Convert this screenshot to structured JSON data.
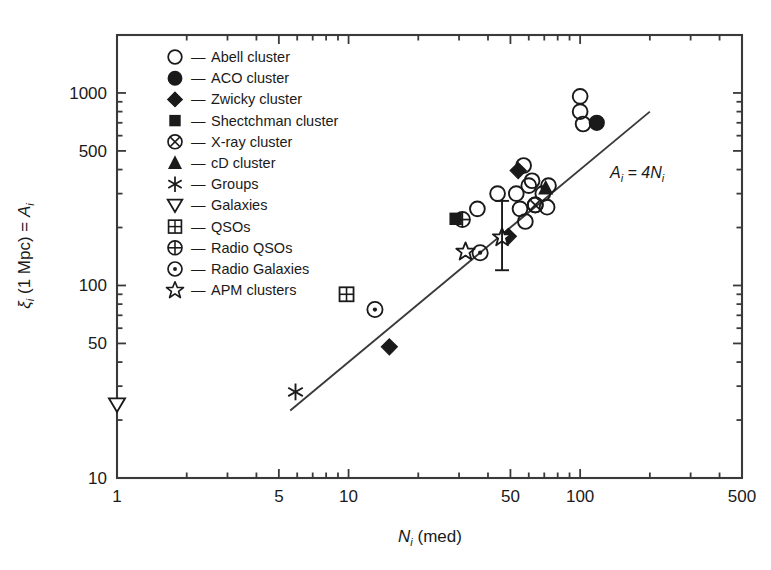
{
  "chart_data": {
    "type": "scatter",
    "title": "",
    "xlabel": "N_i (med)",
    "ylabel": "xi_i (1 Mpc) = A_i",
    "xscale": "log",
    "yscale": "log",
    "xlim": [
      1,
      500
    ],
    "ylim": [
      10,
      2000
    ],
    "xticks": [
      1,
      5,
      10,
      50,
      100,
      500
    ],
    "xtick_labels": [
      "1",
      "5",
      "10",
      "50",
      "100",
      "500"
    ],
    "yticks": [
      10,
      50,
      100,
      500,
      1000
    ],
    "ytick_labels": [
      "10",
      "50",
      "100",
      "500",
      "1000"
    ],
    "grid": false,
    "legend_position": "upper-left-inside",
    "annotations": [
      {
        "text": "A_i = 4N_i",
        "x": 160,
        "y": 330,
        "display": "Ai = 4Ni"
      }
    ],
    "fit_line": {
      "label": "A_i = 4N_i",
      "slope": 1,
      "intercept_factor": 4,
      "x_start": 5.6,
      "x_end": 200
    },
    "series": [
      {
        "name": "Abell cluster",
        "marker": "open-circle",
        "points": [
          {
            "x": 100,
            "y": 960
          },
          {
            "x": 100,
            "y": 800
          },
          {
            "x": 103,
            "y": 690
          },
          {
            "x": 44,
            "y": 300
          },
          {
            "x": 57,
            "y": 420
          },
          {
            "x": 60,
            "y": 330
          },
          {
            "x": 53,
            "y": 300
          },
          {
            "x": 55,
            "y": 250
          },
          {
            "x": 58,
            "y": 215
          },
          {
            "x": 64,
            "y": 262
          },
          {
            "x": 69,
            "y": 300
          },
          {
            "x": 73,
            "y": 330
          },
          {
            "x": 72,
            "y": 255
          },
          {
            "x": 62,
            "y": 350
          },
          {
            "x": 36,
            "y": 250
          }
        ]
      },
      {
        "name": "ACO cluster",
        "marker": "filled-circle",
        "points": [
          {
            "x": 118,
            "y": 700
          }
        ]
      },
      {
        "name": "Zwicky cluster",
        "marker": "filled-diamond",
        "points": [
          {
            "x": 15,
            "y": 48
          },
          {
            "x": 49,
            "y": 180
          },
          {
            "x": 54,
            "y": 395
          }
        ]
      },
      {
        "name": "Shectchman cluster",
        "marker": "filled-square",
        "points": [
          {
            "x": 29,
            "y": 222
          }
        ]
      },
      {
        "name": "X-ray cluster",
        "marker": "circle-cross-diag",
        "points": [
          {
            "x": 64,
            "y": 262
          }
        ]
      },
      {
        "name": "cD cluster",
        "marker": "filled-triangle-up",
        "points": [
          {
            "x": 71,
            "y": 320
          }
        ]
      },
      {
        "name": "Groups",
        "marker": "asterisk",
        "points": [
          {
            "x": 5.9,
            "y": 28
          }
        ]
      },
      {
        "name": "Galaxies",
        "marker": "open-triangle-down",
        "points": [
          {
            "x": 1.0,
            "y": 24
          }
        ]
      },
      {
        "name": "QSOs",
        "marker": "square-windowpane",
        "points": [
          {
            "x": 9.8,
            "y": 90
          }
        ]
      },
      {
        "name": "Radio QSOs",
        "marker": "circle-plus",
        "points": [
          {
            "x": 31,
            "y": 220
          }
        ]
      },
      {
        "name": "Radio Galaxies",
        "marker": "circle-dot",
        "points": [
          {
            "x": 13,
            "y": 75
          },
          {
            "x": 37,
            "y": 148
          }
        ]
      },
      {
        "name": "APM clusters",
        "marker": "open-star",
        "points": [
          {
            "x": 32,
            "y": 150
          },
          {
            "x": 46,
            "y": 178,
            "yerr_low": 120,
            "yerr_high": 275
          }
        ]
      }
    ],
    "legend_entries": [
      {
        "marker": "open-circle",
        "dash": "—",
        "label": "Abell cluster"
      },
      {
        "marker": "filled-circle",
        "dash": "—",
        "label": "ACO cluster"
      },
      {
        "marker": "filled-diamond",
        "dash": "—",
        "label": "Zwicky cluster"
      },
      {
        "marker": "filled-square",
        "dash": "—",
        "label": "Shectchman cluster"
      },
      {
        "marker": "circle-cross-diag",
        "dash": "—",
        "label": "X-ray cluster"
      },
      {
        "marker": "filled-triangle-up",
        "dash": "—",
        "label": "cD cluster"
      },
      {
        "marker": "asterisk",
        "dash": "—",
        "label": "Groups"
      },
      {
        "marker": "open-triangle-down",
        "dash": "—",
        "label": "Galaxies"
      },
      {
        "marker": "square-windowpane",
        "dash": "—",
        "label": "QSOs"
      },
      {
        "marker": "circle-plus",
        "dash": "—",
        "label": "Radio QSOs"
      },
      {
        "marker": "circle-dot",
        "dash": "—",
        "label": "Radio Galaxies"
      },
      {
        "marker": "open-star",
        "dash": "—",
        "label": "APM clusters"
      }
    ]
  },
  "axes": {
    "x_title_main": "N",
    "x_title_sub": "i",
    "x_title_tail": " (med)",
    "y_title_xi": "ξ",
    "y_title_xi_sub": "i",
    "y_title_mid": " (1 Mpc) = ",
    "y_title_A": "A",
    "y_title_A_sub": "i",
    "xtick_labels": [
      "1",
      "5",
      "10",
      "50",
      "100",
      "500"
    ],
    "ytick_labels": [
      "10",
      "50",
      "100",
      "500",
      "1000"
    ]
  },
  "annotation": {
    "A": "A",
    "A_sub": "i",
    "eq": " = 4",
    "N": "N",
    "N_sub": "i"
  },
  "colors": {
    "ink": "#1a1a1a",
    "background": "#ffffff",
    "marker_fill": "#1a1a1a",
    "marker_open": "none"
  }
}
